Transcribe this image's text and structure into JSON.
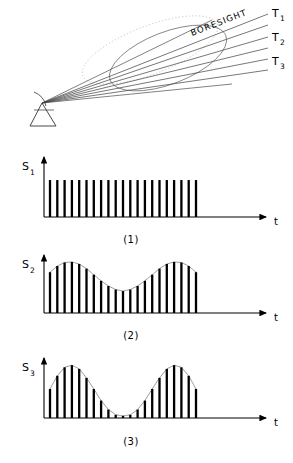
{
  "figure": {
    "title_caption_style": "numbered",
    "background_color": "#ffffff",
    "ink_color": "#000000",
    "beam_line_color": "#555555",
    "envelope_color": "#777777"
  },
  "antenna_diagram": {
    "name": "radar-beam-scan-diagram",
    "boresight_label": "BORESIGHT",
    "beam_labels": [
      {
        "id": "T1",
        "base": "T",
        "sub": "1"
      },
      {
        "id": "T2",
        "base": "T",
        "sub": "2"
      },
      {
        "id": "T3",
        "base": "T",
        "sub": "3"
      }
    ],
    "apex": {
      "x": 42,
      "y": 103
    },
    "beam_rays": [
      {
        "name": "ray-t1-upper",
        "x2": 268,
        "y2": 14
      },
      {
        "name": "ray-t1-lower",
        "x2": 268,
        "y2": 24
      },
      {
        "name": "ray-t2-upper",
        "x2": 268,
        "y2": 36
      },
      {
        "name": "ray-t2-lower",
        "x2": 268,
        "y2": 46
      },
      {
        "name": "ray-t3-upper",
        "x2": 268,
        "y2": 58
      },
      {
        "name": "ray-t3-lower",
        "x2": 268,
        "y2": 68
      }
    ],
    "beam_cross_section": {
      "name": "beam-ellipse",
      "cx": 168,
      "cy": 58,
      "rx": 62,
      "ry": 26,
      "rotation": -21
    },
    "dotted_lobe": {
      "name": "beam-lobe-dotted",
      "cx": 150,
      "cy": 50,
      "rx": 72,
      "ry": 24,
      "rotation": -21
    },
    "antenna_symbol": {
      "name": "antenna-triangle",
      "apex_x": 42,
      "apex_y": 103,
      "left_x": 30,
      "left_y": 125,
      "right_x": 56,
      "right_y": 125
    }
  },
  "chart_data": [
    {
      "type": "bar",
      "name": "signal-plot-1",
      "title": "(1)",
      "ylabel": "S",
      "ylabel_sub": "1",
      "xlabel": "t",
      "envelope": "uniform",
      "n_pulses": 21,
      "ylim": [
        0,
        1
      ],
      "values": [
        0.7,
        0.7,
        0.7,
        0.7,
        0.7,
        0.7,
        0.7,
        0.7,
        0.7,
        0.7,
        0.7,
        0.7,
        0.7,
        0.7,
        0.7,
        0.7,
        0.7,
        0.7,
        0.7,
        0.7,
        0.7
      ],
      "grid": false,
      "legend": "none"
    },
    {
      "type": "bar",
      "name": "signal-plot-2",
      "title": "(2)",
      "ylabel": "S",
      "ylabel_sub": "2",
      "xlabel": "t",
      "envelope": "shallow-cosine",
      "envelope_min": 0.42,
      "envelope_max": 1.0,
      "n_pulses": 21,
      "ylim": [
        0,
        1
      ],
      "values": [
        0.8,
        0.92,
        0.99,
        1.0,
        0.96,
        0.87,
        0.75,
        0.63,
        0.53,
        0.46,
        0.43,
        0.46,
        0.53,
        0.63,
        0.75,
        0.87,
        0.96,
        1.0,
        0.99,
        0.92,
        0.8
      ],
      "grid": false,
      "legend": "none"
    },
    {
      "type": "bar",
      "name": "signal-plot-3",
      "title": "(3)",
      "ylabel": "S",
      "ylabel_sub": "3",
      "xlabel": "t",
      "envelope": "deep-cosine",
      "envelope_min": 0.04,
      "envelope_max": 1.0,
      "n_pulses": 21,
      "ylim": [
        0,
        1
      ],
      "values": [
        0.55,
        0.8,
        0.96,
        1.0,
        0.93,
        0.76,
        0.55,
        0.33,
        0.16,
        0.06,
        0.04,
        0.06,
        0.16,
        0.33,
        0.55,
        0.76,
        0.93,
        1.0,
        0.96,
        0.8,
        0.55
      ],
      "grid": false,
      "legend": "none"
    }
  ],
  "plot_geometry": {
    "origin_x": 44,
    "pulse_start_x": 50,
    "pulse_end_x": 196,
    "axis_end_x": 268,
    "arrow_label_offset_x": 6,
    "panels": [
      {
        "name": "panel-1",
        "baseline_y": 217,
        "top_y": 157,
        "caption_y": 243
      },
      {
        "name": "panel-2",
        "baseline_y": 313,
        "top_y": 255,
        "caption_y": 339
      },
      {
        "name": "panel-3",
        "baseline_y": 418,
        "top_y": 358,
        "caption_y": 445
      }
    ]
  }
}
